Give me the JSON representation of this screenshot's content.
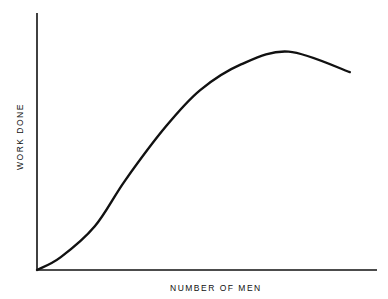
{
  "chart_data": {
    "type": "line",
    "title": "",
    "xlabel": "NUMBER OF MEN",
    "ylabel": "WORK DONE",
    "grid": false,
    "legend": null,
    "axis_ticks": "none",
    "series": [
      {
        "name": "Work done vs. number of men",
        "x": [
          0,
          0.07,
          0.17,
          0.26,
          0.38,
          0.48,
          0.6,
          0.74,
          0.92
        ],
        "y": [
          0,
          0.05,
          0.17,
          0.35,
          0.56,
          0.7,
          0.8,
          0.85,
          0.77
        ]
      }
    ],
    "xlim": [
      0,
      1
    ],
    "ylim": [
      0,
      1
    ],
    "annotations": []
  },
  "labels": {
    "x_axis": "NUMBER OF MEN",
    "y_axis": "WORK DONE"
  }
}
